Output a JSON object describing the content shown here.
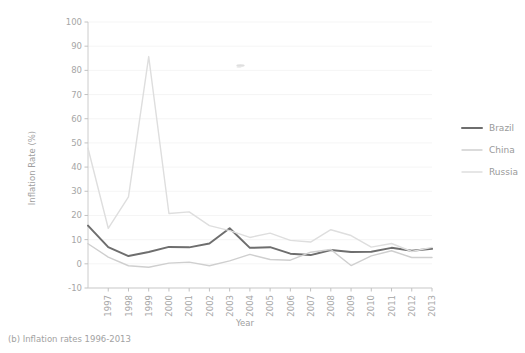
{
  "caption": "(b) Inflation rates 1996-2013",
  "chart_data": {
    "type": "line",
    "title": "",
    "xlabel": "Year",
    "ylabel": "Inflation Rate (%)",
    "x": [
      1996,
      1997,
      1998,
      1999,
      2000,
      2001,
      2002,
      2003,
      2004,
      2005,
      2006,
      2007,
      2008,
      2009,
      2010,
      2011,
      2012,
      2013
    ],
    "xtick_labels": [
      "1996",
      "1997",
      "1998",
      "1999",
      "2000",
      "2001",
      "2002",
      "2003",
      "2004",
      "2005",
      "2006",
      "2007",
      "2008",
      "2009",
      "2010",
      "2011",
      "2012",
      "2013"
    ],
    "ytick_labels": [
      "-10",
      "0",
      "10",
      "20",
      "30",
      "40",
      "50",
      "60",
      "70",
      "80",
      "90",
      "100"
    ],
    "yticks": [
      -10,
      0,
      10,
      20,
      30,
      40,
      50,
      60,
      70,
      80,
      90,
      100
    ],
    "ylim": [
      -10,
      100
    ],
    "xlim": [
      1996,
      2013
    ],
    "grid": true,
    "legend_position": "right",
    "series": [
      {
        "name": "Brazil",
        "color": "#6e6e6e",
        "width": 2.0,
        "values": [
          15.8,
          6.9,
          3.2,
          4.9,
          7.0,
          6.8,
          8.4,
          14.7,
          6.6,
          6.9,
          4.2,
          3.6,
          5.7,
          4.9,
          5.0,
          6.6,
          5.4,
          6.2
        ]
      },
      {
        "name": "China",
        "color": "#cfcfcf",
        "width": 1.4,
        "values": [
          8.3,
          2.8,
          -0.8,
          -1.4,
          0.3,
          0.7,
          -0.8,
          1.2,
          3.9,
          1.8,
          1.5,
          4.8,
          5.9,
          -0.7,
          3.3,
          5.4,
          2.6,
          2.6
        ]
      },
      {
        "name": "Russia",
        "color": "#dedede",
        "width": 1.4,
        "values": [
          47.8,
          14.7,
          27.7,
          85.7,
          20.8,
          21.5,
          15.8,
          13.7,
          10.9,
          12.7,
          9.7,
          9.0,
          14.1,
          11.7,
          6.9,
          8.4,
          5.1,
          6.8
        ]
      }
    ]
  },
  "legend": {
    "items": [
      {
        "label": "Brazil"
      },
      {
        "label": "China"
      },
      {
        "label": "Russia"
      }
    ]
  }
}
